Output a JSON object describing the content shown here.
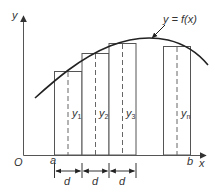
{
  "diagram": {
    "curve_label": "y = f(x)",
    "axes": {
      "y_label": "y",
      "x_label": "x",
      "origin_label": "O"
    },
    "limits": {
      "a_label": "a",
      "b_label": "b"
    },
    "strips": [
      {
        "ordinate_label": "y",
        "sub": "1"
      },
      {
        "ordinate_label": "y",
        "sub": "2"
      },
      {
        "ordinate_label": "y",
        "sub": "3"
      },
      {
        "ordinate_label": "y",
        "sub": "n"
      }
    ],
    "width_labels": [
      "d",
      "d",
      "d"
    ],
    "colors": {
      "curve": "#222222",
      "rect_stroke": "#555555",
      "text": "#333333"
    }
  }
}
